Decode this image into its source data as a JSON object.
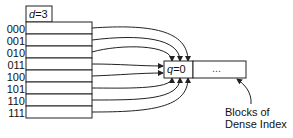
{
  "directory": {
    "global_depth_var": "d",
    "global_depth_value": "3",
    "header": "d=3",
    "rows": [
      "000",
      "001",
      "010",
      "011",
      "100",
      "101",
      "110",
      "111"
    ]
  },
  "bucket": {
    "local_depth_label": "q=0",
    "local_depth_var": "q",
    "local_depth_value": "0",
    "ellipsis": "..."
  },
  "annotation": {
    "line1": "Blocks of",
    "line2": "Dense Index"
  },
  "colors": {
    "stroke": "#222222",
    "background": "#ffffff"
  }
}
